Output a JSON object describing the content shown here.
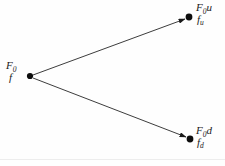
{
  "figure": {
    "type": "binomial-tree-one-step",
    "background_color": "#fefefe",
    "stroke_color": "#1a1a1a",
    "rule_color": "#ededed"
  },
  "nodes": {
    "root": {
      "name": "root-node",
      "x": 30,
      "y": 76,
      "radius": 3.1,
      "label_price": "F",
      "label_price_sub": "0",
      "label_value": "f",
      "label_value_sub": ""
    },
    "up": {
      "name": "up-node",
      "x": 189,
      "y": 17,
      "radius": 3.4,
      "label_price": "F",
      "label_price_sub": "0",
      "label_price_tail": "u",
      "label_value": "f",
      "label_value_sub": "u"
    },
    "down": {
      "name": "down-node",
      "x": 190,
      "y": 139,
      "radius": 3.4,
      "label_price": "F",
      "label_price_sub": "0",
      "label_price_tail": "d",
      "label_value": "f",
      "label_value_sub": "d"
    }
  },
  "edges": [
    {
      "name": "up-branch",
      "from": "root",
      "to": "up",
      "x1": 33,
      "y1": 75,
      "x2": 185,
      "y2": 19
    },
    {
      "name": "down-branch",
      "from": "root",
      "to": "down",
      "x1": 33,
      "y1": 78,
      "x2": 186,
      "y2": 137
    }
  ]
}
